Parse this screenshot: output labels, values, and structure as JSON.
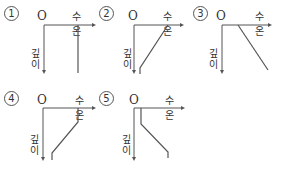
{
  "diagram": {
    "axis_labels": {
      "x": "수온",
      "y_line1": "깊",
      "y_line2": "이",
      "origin": "O"
    },
    "options": [
      {
        "number": "1",
        "description": "constant temperature with depth"
      },
      {
        "number": "2",
        "description": "temperature decreases linearly with depth"
      },
      {
        "number": "3",
        "description": "temperature increases linearly with depth"
      },
      {
        "number": "4",
        "description": "mixed layer, thermocline (decreasing), deep layer"
      },
      {
        "number": "5",
        "description": "cold surface layer, increasing with depth, then constant"
      }
    ]
  }
}
